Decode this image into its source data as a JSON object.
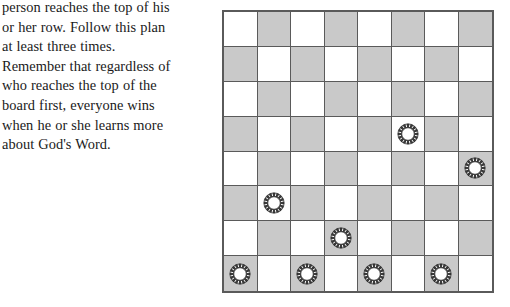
{
  "instructions": {
    "lines": [
      "person reaches the top of his",
      "or her row. Follow this plan",
      "at least three times.",
      "Remember that regardless of",
      "who reaches the top of the",
      "board first, everyone wins",
      "when he or she learns more",
      "about God's Word."
    ],
    "full_text": "person reaches the top of his or her row. Follow this plan at least three times. Remember that regardless of who reaches the top of the board first, everyone wins when he or she learns more about God's Word."
  },
  "board": {
    "label": "checkerboard",
    "rows": 8,
    "columns": 8,
    "light_color": "#ffffff",
    "dark_color": "#c9c9c9",
    "grid_line_color": "#5a5a5a",
    "border_color": "#5a5a5a",
    "checker_ring_color": "#3a3a3a",
    "checker_center_color": "#ffffff",
    "squares": [
      [
        {
          "shade": "light",
          "piece": null
        },
        {
          "shade": "dark",
          "piece": null
        },
        {
          "shade": "light",
          "piece": null
        },
        {
          "shade": "dark",
          "piece": null
        },
        {
          "shade": "light",
          "piece": null
        },
        {
          "shade": "dark",
          "piece": null
        },
        {
          "shade": "light",
          "piece": null
        },
        {
          "shade": "dark",
          "piece": null
        }
      ],
      [
        {
          "shade": "dark",
          "piece": null
        },
        {
          "shade": "light",
          "piece": null
        },
        {
          "shade": "dark",
          "piece": null
        },
        {
          "shade": "light",
          "piece": null
        },
        {
          "shade": "dark",
          "piece": null
        },
        {
          "shade": "light",
          "piece": null
        },
        {
          "shade": "dark",
          "piece": null
        },
        {
          "shade": "light",
          "piece": null
        }
      ],
      [
        {
          "shade": "light",
          "piece": null
        },
        {
          "shade": "dark",
          "piece": null
        },
        {
          "shade": "light",
          "piece": null
        },
        {
          "shade": "dark",
          "piece": null
        },
        {
          "shade": "light",
          "piece": null
        },
        {
          "shade": "dark",
          "piece": null
        },
        {
          "shade": "light",
          "piece": null
        },
        {
          "shade": "dark",
          "piece": null
        }
      ],
      [
        {
          "shade": "dark",
          "piece": null
        },
        {
          "shade": "light",
          "piece": null
        },
        {
          "shade": "dark",
          "piece": null
        },
        {
          "shade": "light",
          "piece": null
        },
        {
          "shade": "dark",
          "piece": null
        },
        {
          "shade": "light",
          "piece": "checker"
        },
        {
          "shade": "dark",
          "piece": null
        },
        {
          "shade": "light",
          "piece": null
        }
      ],
      [
        {
          "shade": "light",
          "piece": null
        },
        {
          "shade": "dark",
          "piece": null
        },
        {
          "shade": "light",
          "piece": null
        },
        {
          "shade": "dark",
          "piece": null
        },
        {
          "shade": "light",
          "piece": null
        },
        {
          "shade": "dark",
          "piece": null
        },
        {
          "shade": "light",
          "piece": null
        },
        {
          "shade": "dark",
          "piece": "checker"
        }
      ],
      [
        {
          "shade": "dark",
          "piece": null
        },
        {
          "shade": "light",
          "piece": "checker"
        },
        {
          "shade": "dark",
          "piece": null
        },
        {
          "shade": "light",
          "piece": null
        },
        {
          "shade": "dark",
          "piece": null
        },
        {
          "shade": "light",
          "piece": null
        },
        {
          "shade": "dark",
          "piece": null
        },
        {
          "shade": "light",
          "piece": null
        }
      ],
      [
        {
          "shade": "light",
          "piece": null
        },
        {
          "shade": "dark",
          "piece": null
        },
        {
          "shade": "light",
          "piece": null
        },
        {
          "shade": "dark",
          "piece": "checker"
        },
        {
          "shade": "light",
          "piece": null
        },
        {
          "shade": "dark",
          "piece": null
        },
        {
          "shade": "light",
          "piece": null
        },
        {
          "shade": "dark",
          "piece": null
        }
      ],
      [
        {
          "shade": "dark",
          "piece": "checker"
        },
        {
          "shade": "light",
          "piece": null
        },
        {
          "shade": "dark",
          "piece": "checker"
        },
        {
          "shade": "light",
          "piece": null
        },
        {
          "shade": "dark",
          "piece": "checker"
        },
        {
          "shade": "light",
          "piece": null
        },
        {
          "shade": "dark",
          "piece": "checker"
        },
        {
          "shade": "light",
          "piece": null
        }
      ]
    ],
    "piece_positions": [
      {
        "row": 4,
        "col": 6
      },
      {
        "row": 5,
        "col": 8
      },
      {
        "row": 6,
        "col": 2
      },
      {
        "row": 7,
        "col": 4
      },
      {
        "row": 8,
        "col": 1
      },
      {
        "row": 8,
        "col": 3
      },
      {
        "row": 8,
        "col": 5
      },
      {
        "row": 8,
        "col": 7
      }
    ],
    "piece_count": 8
  }
}
